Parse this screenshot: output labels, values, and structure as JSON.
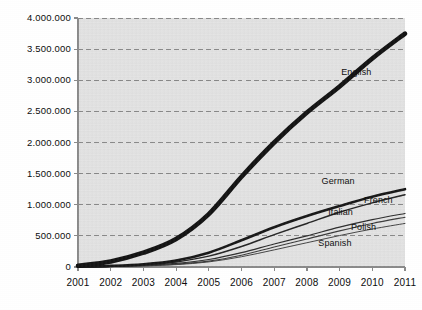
{
  "chart_data": {
    "type": "line",
    "title": "",
    "subtitle": "",
    "xlabel": "",
    "ylabel": "",
    "x": [
      2001,
      2002,
      2003,
      2004,
      2005,
      2006,
      2007,
      2008,
      2009,
      2010,
      2011
    ],
    "xtick_labels": [
      "2001",
      "2002",
      "2003",
      "2004",
      "2005",
      "2006",
      "2007",
      "2008",
      "2009",
      "2010",
      "2011"
    ],
    "ytick_values": [
      0,
      500000,
      1000000,
      1500000,
      2000000,
      2500000,
      3000000,
      3500000,
      4000000
    ],
    "ytick_labels": [
      "0",
      "500.000",
      "1.000.000",
      "1.500.000",
      "2.000.000",
      "2.500.000",
      "3.000.000",
      "3.500.000",
      "4.000.000"
    ],
    "ylim": [
      0,
      4000000
    ],
    "xlim": [
      2001,
      2011
    ],
    "grid": true,
    "grid_style": "dashed-horizontal",
    "legend_position": "inline-at-line-end",
    "plot_background": "#e4e4e4",
    "page_background": "#ffffff",
    "series": [
      {
        "name": "English",
        "label": "English",
        "color": "#111111",
        "width": 4.6,
        "values": [
          20000,
          90000,
          230000,
          450000,
          850000,
          1450000,
          2000000,
          2480000,
          2900000,
          3350000,
          3750000
        ]
      },
      {
        "name": "German",
        "label": "German",
        "color": "#151515",
        "width": 2.6,
        "values": [
          5000,
          18000,
          45000,
          105000,
          230000,
          430000,
          640000,
          820000,
          980000,
          1130000,
          1250000
        ]
      },
      {
        "name": "French",
        "label": "French",
        "color": "#222222",
        "width": 1.5,
        "values": [
          4000,
          14000,
          36000,
          82000,
          175000,
          330000,
          520000,
          700000,
          880000,
          1030000,
          1160000
        ]
      },
      {
        "name": "Italian",
        "label": "Italian",
        "color": "#2b2b2b",
        "width": 1.2,
        "values": [
          3000,
          10000,
          26000,
          58000,
          120000,
          230000,
          370000,
          500000,
          640000,
          760000,
          860000
        ]
      },
      {
        "name": "Polish",
        "label": "Polish",
        "color": "#3a3a3a",
        "width": 1.1,
        "values": [
          2000,
          8000,
          20000,
          45000,
          95000,
          190000,
          320000,
          450000,
          580000,
          700000,
          800000
        ]
      },
      {
        "name": "Spanish",
        "label": "Spanish",
        "color": "#444444",
        "width": 1.0,
        "values": [
          2000,
          7000,
          17000,
          38000,
          82000,
          165000,
          275000,
          390000,
          505000,
          610000,
          700000
        ]
      }
    ],
    "series_label_positions": [
      {
        "name": "English",
        "x": 2009.05,
        "y": 3130000,
        "bold": false
      },
      {
        "name": "German",
        "x": 2008.45,
        "y": 1390000,
        "bold": false
      },
      {
        "name": "French",
        "x": 2009.75,
        "y": 1080000,
        "bold": false
      },
      {
        "name": "Italian",
        "x": 2008.65,
        "y": 880000,
        "bold": false
      },
      {
        "name": "Polish",
        "x": 2009.35,
        "y": 650000,
        "bold": false
      },
      {
        "name": "Spanish",
        "x": 2008.35,
        "y": 390000,
        "bold": false
      }
    ],
    "axis": {
      "line_color": "#8a8a8a",
      "grid_color": "#7d7d7d",
      "tick_color": "#8a8a8a"
    }
  }
}
